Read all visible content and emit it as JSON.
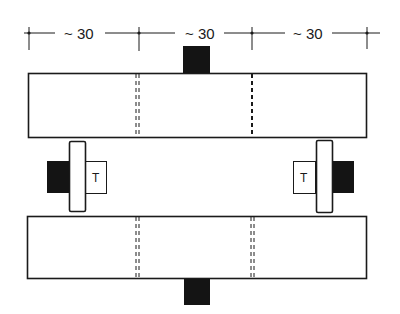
{
  "diagram": {
    "dimensions": {
      "labels": [
        "~ 30",
        "~ 30",
        "~ 30"
      ]
    },
    "components": {
      "top_beam": "beam",
      "bottom_beam": "beam",
      "left_post_label": "T",
      "right_post_label": "T"
    },
    "colors": {
      "line": "#1a1a1a",
      "fill_block": "#141414",
      "background": "#ffffff"
    }
  }
}
